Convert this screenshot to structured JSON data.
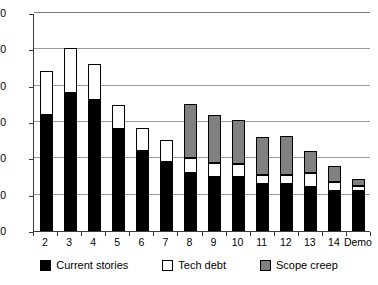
{
  "chart_data": {
    "type": "bar",
    "stacked": true,
    "title": "",
    "xlabel": "",
    "ylabel": "",
    "ylim": [
      0,
      300
    ],
    "ytick_step": 50,
    "yticks": [
      0,
      50,
      100,
      150,
      200,
      250,
      300
    ],
    "grid": true,
    "legend_position": "bottom",
    "categories": [
      "2",
      "3",
      "4",
      "5",
      "6",
      "7",
      "8",
      "9",
      "10",
      "11",
      "12",
      "13",
      "14",
      "Demo"
    ],
    "series": [
      {
        "name": "Current stories",
        "color": "#000000",
        "values": [
          160,
          190,
          180,
          140,
          110,
          95,
          80,
          75,
          75,
          65,
          65,
          60,
          55,
          55
        ]
      },
      {
        "name": "Tech debt",
        "color": "#FFFFFF",
        "values": [
          60,
          62,
          50,
          33,
          32,
          30,
          20,
          18,
          17,
          12,
          12,
          20,
          12,
          7
        ]
      },
      {
        "name": "Scope creep",
        "color": "#808080",
        "values": [
          0,
          0,
          0,
          0,
          0,
          0,
          75,
          67,
          61,
          52,
          54,
          30,
          22,
          10
        ]
      }
    ],
    "totals": [
      220,
      252,
      230,
      173,
      142,
      125,
      175,
      160,
      153,
      129,
      131,
      110,
      89,
      72
    ]
  },
  "legend": {
    "items": [
      {
        "label": "Current stories",
        "swatch": "legend-swatch-current-stories"
      },
      {
        "label": "Tech debt",
        "swatch": "legend-swatch-tech-debt"
      },
      {
        "label": "Scope creep",
        "swatch": "legend-swatch-scope-creep"
      }
    ]
  }
}
